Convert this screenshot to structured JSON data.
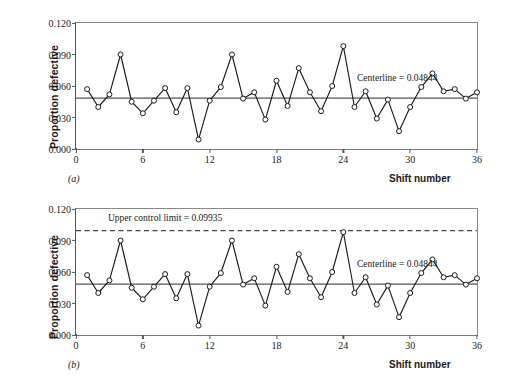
{
  "figure": {
    "ylabel": "Proportion defective",
    "xlabel": "Shift number",
    "panel_a_letter": "(a)",
    "panel_b_letter": "(b)",
    "caption_partial": ""
  },
  "axes": {
    "yticks": [
      "0.000",
      "0.030",
      "0.060",
      "0.090",
      "0.120"
    ],
    "ytick_values": [
      0.0,
      0.03,
      0.06,
      0.09,
      0.12
    ],
    "xticks": [
      "0",
      "6",
      "12",
      "18",
      "24",
      "30",
      "36"
    ],
    "xtick_values": [
      0,
      6,
      12,
      18,
      24,
      30,
      36
    ],
    "ylim": [
      0.0,
      0.12
    ],
    "xlim": [
      0,
      36
    ]
  },
  "annotations": {
    "centerline_label": "Centerline = 0.04844",
    "ucl_label": "Upper control limit = 0.09935"
  },
  "colors": {
    "line": "#1a1a1a",
    "marker_fill": "#ffffff",
    "centerline": "#555555",
    "ucl": "#444444",
    "frame": "#888888"
  },
  "chart_data": [
    {
      "type": "line",
      "panel": "(a)",
      "title": "",
      "xlabel": "Shift number",
      "ylabel": "Proportion defective",
      "xlim": [
        0,
        36
      ],
      "ylim": [
        0.0,
        0.12
      ],
      "grid": false,
      "legend": "none",
      "x": [
        1,
        2,
        3,
        4,
        5,
        6,
        7,
        8,
        9,
        10,
        11,
        12,
        13,
        14,
        15,
        16,
        17,
        18,
        19,
        20,
        21,
        22,
        23,
        24,
        25,
        26,
        27,
        28,
        29,
        30,
        31,
        32,
        33,
        34,
        35,
        36
      ],
      "values": [
        0.057,
        0.04,
        0.052,
        0.09,
        0.045,
        0.034,
        0.046,
        0.058,
        0.035,
        0.058,
        0.009,
        0.046,
        0.059,
        0.09,
        0.048,
        0.054,
        0.028,
        0.065,
        0.041,
        0.077,
        0.054,
        0.036,
        0.06,
        0.098,
        0.04,
        0.055,
        0.029,
        0.047,
        0.017,
        0.04,
        0.059,
        0.072,
        0.055,
        0.057,
        0.048,
        0.054
      ],
      "reference_lines": [
        {
          "name": "centerline",
          "value": 0.04844,
          "label": "Centerline = 0.04844",
          "style": "solid"
        }
      ]
    },
    {
      "type": "line",
      "panel": "(b)",
      "title": "",
      "xlabel": "Shift number",
      "ylabel": "Proportion defective",
      "xlim": [
        0,
        36
      ],
      "ylim": [
        0.0,
        0.12
      ],
      "grid": false,
      "legend": "none",
      "x": [
        1,
        2,
        3,
        4,
        5,
        6,
        7,
        8,
        9,
        10,
        11,
        12,
        13,
        14,
        15,
        16,
        17,
        18,
        19,
        20,
        21,
        22,
        23,
        24,
        25,
        26,
        27,
        28,
        29,
        30,
        31,
        32,
        33,
        34,
        35,
        36
      ],
      "values": [
        0.057,
        0.04,
        0.052,
        0.09,
        0.045,
        0.034,
        0.046,
        0.058,
        0.035,
        0.058,
        0.009,
        0.046,
        0.059,
        0.09,
        0.048,
        0.054,
        0.028,
        0.065,
        0.041,
        0.077,
        0.054,
        0.036,
        0.06,
        0.098,
        0.04,
        0.055,
        0.029,
        0.047,
        0.017,
        0.04,
        0.059,
        0.072,
        0.055,
        0.057,
        0.048,
        0.054
      ],
      "reference_lines": [
        {
          "name": "centerline",
          "value": 0.04844,
          "label": "Centerline = 0.04844",
          "style": "solid"
        },
        {
          "name": "upper-control-limit",
          "value": 0.09935,
          "label": "Upper control limit = 0.09935",
          "style": "dashed"
        }
      ]
    }
  ]
}
